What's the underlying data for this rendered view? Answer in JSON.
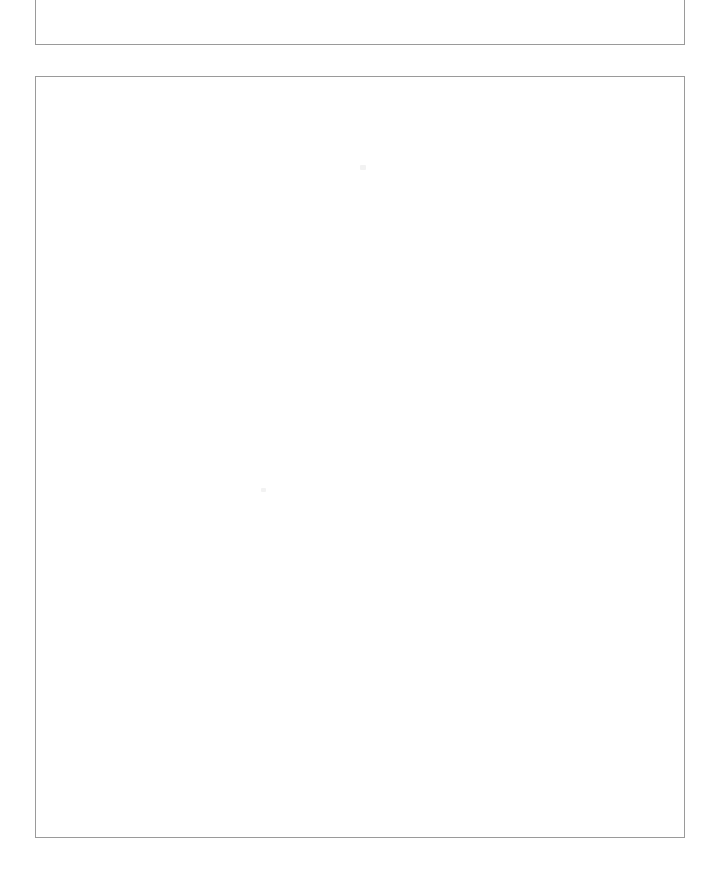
{
  "page": {
    "background_color": "#ffffff",
    "width": 721,
    "height": 887
  },
  "frames": {
    "border_color": "#9a9a9a",
    "fill_color": "#ffffff",
    "top_frame": {
      "name": "upper-bordered-box",
      "clipped": true,
      "heading_text": "Description of the document",
      "content": ""
    },
    "main_frame": {
      "name": "lower-bordered-box",
      "clipped": false,
      "content": ""
    }
  },
  "artifacts": {
    "speck_color": "#f2f2f2",
    "items": [
      {
        "label": "scan-speck-upper"
      },
      {
        "label": "scan-speck-middle"
      }
    ]
  }
}
